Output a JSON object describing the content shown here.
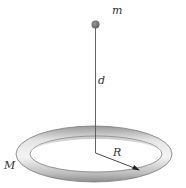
{
  "figure": {
    "labels": {
      "point_mass": "m",
      "distance": "d",
      "radius": "R",
      "ring_mass": "M"
    },
    "colors": {
      "ring_light": "#f2f2f2",
      "ring_mid": "#c8c8c8",
      "ring_dark": "#8a8a8a",
      "point_mass": "#6f6f6f",
      "line": "#555555"
    }
  }
}
